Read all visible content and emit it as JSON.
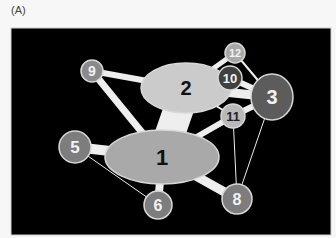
{
  "panel_label": "(A)",
  "colors": {
    "page_background": "#f7f7f7",
    "panel_background": "#000000",
    "edge": "#eeeeee",
    "node_light": "#c8c8c8",
    "node_medium": "#9a9a9a",
    "node_mid_dark": "#7a7a7a",
    "node_dark": "#5a5a5a",
    "node_stroke": "#d8d8d8",
    "label_dark": "#111111",
    "label_light": "#f2f2f2"
  },
  "panel": {
    "x": 11,
    "y": 28,
    "width": 320,
    "height": 207
  },
  "nodes": [
    {
      "id": "1",
      "label": "1",
      "shape": "ellipse",
      "cx": 162,
      "cy": 157,
      "rx": 57,
      "ry": 27,
      "fill": "#a9a9a9",
      "text": "#111111",
      "font": 22
    },
    {
      "id": "2",
      "label": "2",
      "shape": "ellipse",
      "cx": 186,
      "cy": 88,
      "rx": 45,
      "ry": 25,
      "fill": "#cbcbcb",
      "text": "#111111",
      "font": 20
    },
    {
      "id": "3",
      "label": "3",
      "shape": "ellipse",
      "cx": 272,
      "cy": 97,
      "rx": 21,
      "ry": 23,
      "fill": "#5c5c5c",
      "text": "#f2f2f2",
      "font": 20
    },
    {
      "id": "5",
      "label": "5",
      "shape": "circle",
      "cx": 75,
      "cy": 147,
      "r": 16,
      "fill": "#7d7d7d",
      "text": "#f2f2f2",
      "font": 17
    },
    {
      "id": "6",
      "label": "6",
      "shape": "circle",
      "cx": 158,
      "cy": 205,
      "r": 14,
      "fill": "#7d7d7d",
      "text": "#f2f2f2",
      "font": 16
    },
    {
      "id": "8",
      "label": "8",
      "shape": "circle",
      "cx": 237,
      "cy": 199,
      "r": 15,
      "fill": "#7d7d7d",
      "text": "#f2f2f2",
      "font": 16
    },
    {
      "id": "9",
      "label": "9",
      "shape": "circle",
      "cx": 92,
      "cy": 71,
      "r": 11,
      "fill": "#8a8a8a",
      "text": "#f2f2f2",
      "font": 14
    },
    {
      "id": "10",
      "label": "10",
      "shape": "circle",
      "cx": 230,
      "cy": 78,
      "r": 12,
      "fill": "#404040",
      "text": "#f2f2f2",
      "font": 13
    },
    {
      "id": "11",
      "label": "11",
      "shape": "circle",
      "cx": 233,
      "cy": 116,
      "r": 12,
      "fill": "#b9b9b9",
      "text": "#222222",
      "font": 13
    },
    {
      "id": "12",
      "label": "12",
      "shape": "circle",
      "cx": 235,
      "cy": 53,
      "r": 10,
      "fill": "#a8a8a8",
      "text": "#f2f2f2",
      "font": 11
    }
  ],
  "edges": [
    {
      "from": "2",
      "to": "1",
      "width": 30
    },
    {
      "from": "9",
      "to": "2",
      "width": 6
    },
    {
      "from": "9",
      "to": "1",
      "width": 7
    },
    {
      "from": "5",
      "to": "1",
      "width": 10
    },
    {
      "from": "5",
      "to": "6",
      "width": 1
    },
    {
      "from": "6",
      "to": "1",
      "width": 8
    },
    {
      "from": "8",
      "to": "1",
      "width": 9
    },
    {
      "from": "8",
      "to": "11",
      "width": 1
    },
    {
      "from": "8",
      "to": "3",
      "width": 1
    },
    {
      "from": "2",
      "to": "12",
      "width": 5
    },
    {
      "from": "2",
      "to": "10",
      "width": 6
    },
    {
      "from": "2",
      "to": "3",
      "width": 9
    },
    {
      "from": "2",
      "to": "11",
      "width": 2
    },
    {
      "from": "12",
      "to": "3",
      "width": 2
    },
    {
      "from": "10",
      "to": "3",
      "width": 6
    },
    {
      "from": "11",
      "to": "3",
      "width": 6
    },
    {
      "from": "11",
      "to": "1",
      "width": 6
    },
    {
      "from": "3",
      "to": "1",
      "width": 2
    }
  ]
}
